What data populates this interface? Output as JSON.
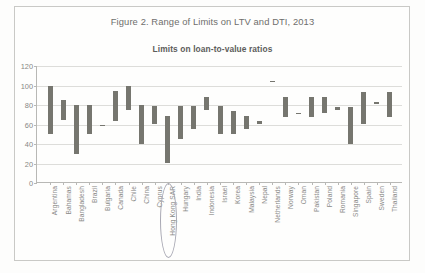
{
  "figure": {
    "caption": "Figure 2. Range of Limits on LTV and DTI, 2013",
    "subtitle": "Limits on loan-to-value ratios"
  },
  "annotation": {
    "circled_label": "Hong Kong SAR"
  },
  "colors": {
    "bar": "#76766f",
    "grid": "#ddddda",
    "axis": "#b8b8b5",
    "text": "#8a8a88",
    "annotation_circle": "#a9a9b4",
    "page_background": "#fefefd",
    "frame_border": "#c9c9c6"
  },
  "chart_data": {
    "type": "bar",
    "variant": "floating-range-bar",
    "title": "Limits on loan-to-value ratios",
    "xlabel": "",
    "ylabel": "",
    "ylim": [
      0,
      120
    ],
    "yticks": [
      0,
      20,
      40,
      60,
      80,
      100,
      120
    ],
    "grid": true,
    "legend": "none",
    "categories": [
      "Argentina",
      "Bahamas",
      "Bangladesh",
      "Brazil",
      "Bulgaria",
      "Canada",
      "Chile",
      "China",
      "Cyprus",
      "Hong Kong SAR",
      "Hungary",
      "India",
      "Indonesia",
      "Israel",
      "Korea",
      "Malaysia",
      "Nepal",
      "Netherlands",
      "Norway",
      "Oman",
      "Pakistan",
      "Poland",
      "Romania",
      "Singapore",
      "Spain",
      "Sweden",
      "Thailand"
    ],
    "series": [
      {
        "name": "Lower limit",
        "values": [
          50,
          65,
          30,
          50,
          60,
          64,
          75,
          40,
          60,
          20,
          45,
          55,
          75,
          50,
          50,
          55,
          60,
          105,
          68,
          72,
          68,
          72,
          75,
          40,
          60,
          83,
          68
        ]
      },
      {
        "name": "Upper limit",
        "values": [
          100,
          85,
          80,
          80,
          60,
          94,
          99,
          80,
          79,
          69,
          79,
          79,
          88,
          79,
          74,
          69,
          64,
          105,
          88,
          72,
          88,
          88,
          78,
          78,
          93,
          83,
          93
        ]
      }
    ]
  }
}
